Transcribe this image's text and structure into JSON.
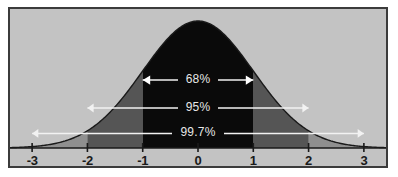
{
  "figure": {
    "kind": "normal-distribution-empirical-rule",
    "background_color": "#ffffff",
    "panel_color": "#c3c3c3",
    "frame_color": "#3b3b3b",
    "axis_color": "#1a1a1a",
    "annotation_line_color": "#f2f2f2"
  },
  "chart_data": {
    "type": "area",
    "title": "",
    "subtitle": "",
    "xlabel": "",
    "ylabel": "",
    "xlim": [
      -3.4,
      3.4
    ],
    "ylim": [
      0,
      1.08
    ],
    "grid": false,
    "legend_position": "none",
    "curve": {
      "name": "standard normal density",
      "distribution": "normal",
      "mean": 0,
      "sd": 1,
      "fill_color": "#0a0a0a",
      "line_color": "#1a1a1a"
    },
    "x_axis": {
      "ticks": [
        -3,
        -2,
        -1,
        0,
        1,
        2,
        3
      ],
      "tick_labels": [
        "-3",
        "-2",
        "-1",
        "0",
        "1",
        "2",
        "3"
      ]
    },
    "shaded_bands": [
      {
        "name": "within-1-sd",
        "from": -1,
        "to": 1,
        "color": "#0a0a0a",
        "percent": 68
      },
      {
        "name": "1-to-2-sd-left",
        "from": -2,
        "to": -1,
        "color": "#555555",
        "percent": 13.5
      },
      {
        "name": "1-to-2-sd-right",
        "from": 1,
        "to": 2,
        "color": "#555555",
        "percent": 13.5
      },
      {
        "name": "2-to-3-sd-left",
        "from": -3,
        "to": -2,
        "color": "#8f8f8f",
        "percent": 2.35
      },
      {
        "name": "2-to-3-sd-right",
        "from": 2,
        "to": 3,
        "color": "#8f8f8f",
        "percent": 2.35
      }
    ],
    "annotations": [
      {
        "id": "band-68",
        "label": "68%",
        "from": -1,
        "to": 1,
        "y_frac": 0.535,
        "arrow": "double-line"
      },
      {
        "id": "band-95",
        "label": "95%",
        "from": -2,
        "to": 2,
        "y_frac": 0.315,
        "arrow": "double-triangle"
      },
      {
        "id": "band-99-7",
        "label": "99.7%",
        "from": -3,
        "to": 3,
        "y_frac": 0.115,
        "arrow": "double-triangle"
      }
    ]
  },
  "labels": {
    "ticks": {
      "neg3": "-3",
      "neg2": "-2",
      "neg1": "-1",
      "zero": "0",
      "pos1": "1",
      "pos2": "2",
      "pos3": "3"
    },
    "percents": {
      "one_sd": "68%",
      "two_sd": "95%",
      "three_sd": "99.7%"
    }
  }
}
